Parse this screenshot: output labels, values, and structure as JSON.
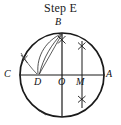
{
  "figure": {
    "title": "Step E",
    "type": "geometric-construction",
    "caption_position": "top-center",
    "colors": {
      "stroke": "#1a1a1a",
      "light_stroke": "#555555",
      "background": "#ffffff",
      "text": "#111111"
    },
    "circle": {
      "center": {
        "x": 62,
        "y": 75
      },
      "radius": 42,
      "stroke_width": 1.6
    },
    "points": [
      {
        "name": "B",
        "label": "B",
        "x": 62,
        "y": 33,
        "label_x": 57,
        "label_y": 19,
        "role": "top-of-circle"
      },
      {
        "name": "C",
        "label": "C",
        "x": 20,
        "y": 75,
        "label_x": 6,
        "label_y": 70,
        "role": "left-endpoint-diameter"
      },
      {
        "name": "D",
        "label": "D",
        "x": 39,
        "y": 75,
        "label_x": 35,
        "label_y": 77,
        "role": "construction-point"
      },
      {
        "name": "O",
        "label": "O",
        "x": 62,
        "y": 75,
        "label_x": 59,
        "label_y": 77,
        "role": "center"
      },
      {
        "name": "M",
        "label": "M",
        "x": 82,
        "y": 75,
        "label_x": 78,
        "label_y": 77,
        "role": "midpoint-OA"
      },
      {
        "name": "A",
        "label": "A",
        "x": 104,
        "y": 75,
        "label_x": 107,
        "label_y": 70,
        "role": "right-endpoint-diameter"
      }
    ],
    "segments": [
      {
        "name": "diameter-CA",
        "x1": 20,
        "y1": 75,
        "x2": 104,
        "y2": 75,
        "width": 1.3
      },
      {
        "name": "vertical-through-B",
        "x1": 62,
        "y1": 33,
        "x2": 62,
        "y2": 117,
        "width": 1.3
      },
      {
        "name": "vertical-through-M",
        "x1": 82,
        "y1": 41,
        "x2": 82,
        "y2": 108,
        "width": 1.1
      },
      {
        "name": "chord-B-to-D",
        "x1": 62,
        "y1": 33,
        "x2": 39,
        "y2": 75,
        "width": 0.9
      }
    ],
    "arcs": [
      {
        "name": "construction-arc-B-D-outer",
        "description": "arc swung from B through left region toward D"
      },
      {
        "name": "construction-arc-B-D-inner",
        "description": "second arc from B toward D"
      },
      {
        "name": "construction-arc-left",
        "description": "small arc crossing near C-D on the left"
      }
    ],
    "tick_marks": [
      {
        "name": "arc-cross-below-B",
        "x": 62,
        "y": 40
      },
      {
        "name": "arc-cross-upper-right",
        "x": 82,
        "y": 46
      },
      {
        "name": "arc-cross-lower-right",
        "x": 82,
        "y": 99
      },
      {
        "name": "arc-cross-left",
        "x": 24,
        "y": 59
      },
      {
        "name": "arc-cross-bottom",
        "x": 42,
        "y": 113
      }
    ]
  }
}
